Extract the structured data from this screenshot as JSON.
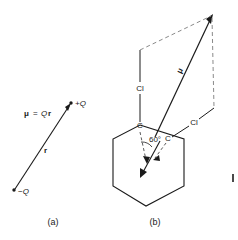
{
  "figure": {
    "background_color": "#ffffff",
    "line_color": "#1a1a1a",
    "dashed_color": "#8a8a8a",
    "width": 238,
    "height": 240
  },
  "panel_a": {
    "caption": "(a)",
    "equation_mu": "μ",
    "equation_equals": "=",
    "equation_q": "Q",
    "equation_r": "r",
    "label_positive_charge": "+Q",
    "label_negative_charge": "−Q",
    "label_separation": "r"
  },
  "panel_b": {
    "caption": "(b)",
    "label_chlorine_left": "Cl",
    "label_chlorine_right": "Cl",
    "label_carbon_left": "C",
    "label_carbon_right": "C",
    "label_resultant": "μ",
    "label_angle": "60°"
  },
  "edge_artifact": {
    "mark": ""
  }
}
